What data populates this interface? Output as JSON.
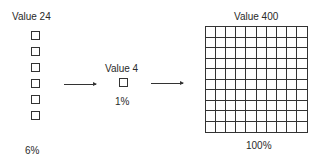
{
  "left": {
    "title": "Value 24",
    "percent": "6%",
    "squares": 6
  },
  "middle": {
    "title": "Value 4",
    "percent": "1%",
    "squares": 1
  },
  "right": {
    "title": "Value 400",
    "percent": "100%",
    "grid_rows": 10,
    "grid_cols": 10
  },
  "arrows": [
    "left-to-middle",
    "middle-to-right"
  ]
}
